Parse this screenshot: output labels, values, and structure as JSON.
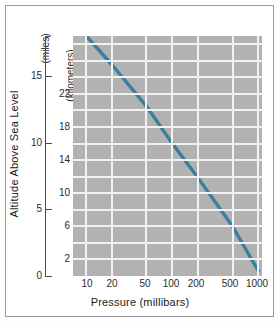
{
  "chart_data": {
    "type": "line",
    "title": "",
    "xlabel": "Pressure (millibars)",
    "ylabel": "Altitude Above Sea Level",
    "y_unit_primary": "(miles)",
    "y_unit_secondary": "(kilometers)",
    "xscale": "log",
    "xlim": [
      7,
      1100
    ],
    "x_ticks": [
      10,
      20,
      50,
      100,
      200,
      500,
      1000
    ],
    "x_tick_labels": [
      "10",
      "20",
      "50",
      "100",
      "200",
      "500",
      "1000"
    ],
    "ylim_miles": [
      0,
      18
    ],
    "y_ticks_miles": [
      0,
      5,
      10,
      15
    ],
    "y_tick_labels_miles": [
      "0",
      "5",
      "10",
      "15"
    ],
    "ylim_km": [
      0,
      29
    ],
    "y_ticks_km": [
      2,
      6,
      10,
      14,
      18,
      22
    ],
    "y_tick_labels_km": [
      "2",
      "6",
      "10",
      "14",
      "18",
      "22"
    ],
    "grid": true,
    "grid_color": "#f2f2f2",
    "plot_background": "#b2b2b2",
    "line_color": "#3b7f9e",
    "legend": "none",
    "series": [
      {
        "name": "Pressure vs Altitude",
        "x": [
          10,
          20,
          50,
          100,
          200,
          500,
          1000
        ],
        "y_km": [
          29.0,
          25.5,
          20.5,
          16.0,
          11.8,
          6.0,
          0.6
        ],
        "y_miles": [
          18.0,
          15.8,
          12.7,
          9.9,
          7.3,
          3.7,
          0.4
        ]
      }
    ]
  },
  "axes": {
    "x_title": "Pressure (millibars)",
    "y_title": "Altitude Above Sea Level",
    "miles_unit": "(miles)",
    "km_unit": "(kilometers)"
  }
}
